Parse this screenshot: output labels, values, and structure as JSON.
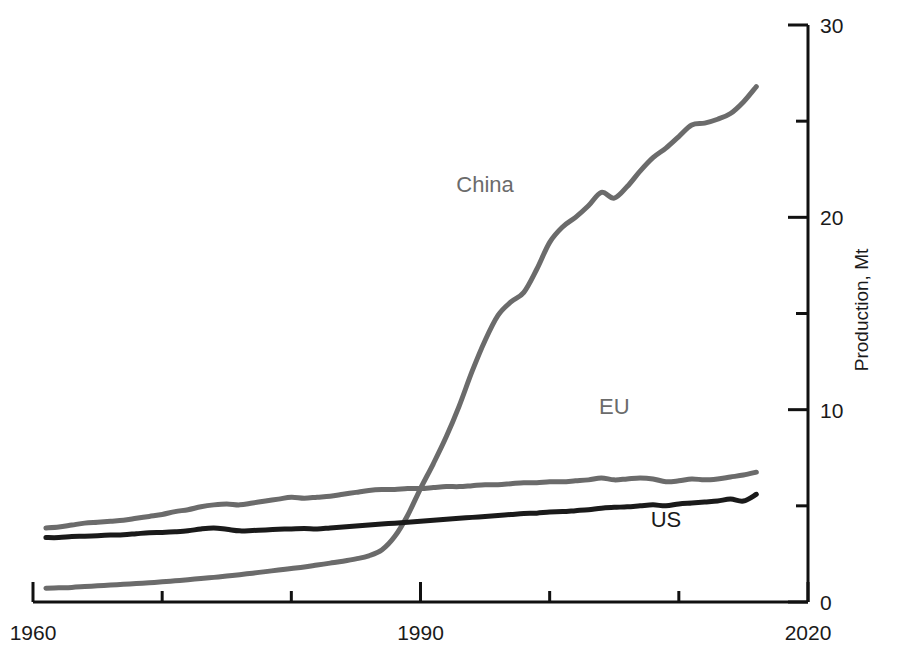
{
  "chart_data": {
    "type": "line",
    "title": "",
    "subtitle": "",
    "xlabel": "",
    "ylabel": "Production, Mt",
    "xlim": [
      1960,
      2020
    ],
    "ylim": [
      0,
      30
    ],
    "x_ticks": [
      1960,
      1990,
      2020
    ],
    "x_tick_labels": [
      "1960",
      "1990",
      "2020"
    ],
    "x_minor_ticks": [
      1970,
      1980,
      2000,
      2010
    ],
    "y_ticks": [
      0,
      10,
      20,
      30
    ],
    "y_tick_labels": [
      "0",
      "10",
      "20",
      "30"
    ],
    "y_minor_ticks": [
      5,
      15,
      25
    ],
    "grid": false,
    "legend_position": "inline-annotations",
    "x": [
      1961,
      1962,
      1963,
      1964,
      1965,
      1966,
      1967,
      1968,
      1969,
      1970,
      1971,
      1972,
      1973,
      1974,
      1975,
      1976,
      1977,
      1978,
      1979,
      1980,
      1981,
      1982,
      1983,
      1984,
      1985,
      1986,
      1987,
      1988,
      1989,
      1990,
      1991,
      1992,
      1993,
      1994,
      1995,
      1996,
      1997,
      1998,
      1999,
      2000,
      2001,
      2002,
      2003,
      2004,
      2005,
      2006,
      2007,
      2008,
      2009,
      2010,
      2011,
      2012,
      2013,
      2014,
      2015,
      2016
    ],
    "series": [
      {
        "name": "China",
        "color": "#6b6b6b",
        "label_x": 1995,
        "label_y": 21.3,
        "values": [
          0.72,
          0.74,
          0.76,
          0.8,
          0.84,
          0.88,
          0.92,
          0.96,
          1.0,
          1.05,
          1.1,
          1.16,
          1.22,
          1.28,
          1.35,
          1.42,
          1.5,
          1.58,
          1.66,
          1.74,
          1.82,
          1.92,
          2.02,
          2.12,
          2.24,
          2.4,
          2.7,
          3.4,
          4.5,
          5.9,
          7.2,
          8.6,
          10.2,
          12.0,
          13.6,
          14.9,
          15.6,
          16.1,
          17.3,
          18.7,
          19.5,
          20.0,
          20.6,
          21.3,
          21.0,
          21.6,
          22.4,
          23.1,
          23.6,
          24.2,
          24.8,
          24.9,
          25.1,
          25.4,
          26.0,
          26.8
        ]
      },
      {
        "name": "EU",
        "color": "#6b6b6b",
        "label_x": 2005,
        "label_y": 9.8,
        "values": [
          3.85,
          3.9,
          4.0,
          4.1,
          4.15,
          4.2,
          4.25,
          4.35,
          4.45,
          4.55,
          4.7,
          4.8,
          4.95,
          5.05,
          5.1,
          5.05,
          5.15,
          5.25,
          5.35,
          5.45,
          5.4,
          5.45,
          5.5,
          5.6,
          5.7,
          5.8,
          5.85,
          5.85,
          5.9,
          5.9,
          5.95,
          6.0,
          6.0,
          6.05,
          6.1,
          6.1,
          6.15,
          6.2,
          6.2,
          6.25,
          6.25,
          6.3,
          6.35,
          6.45,
          6.35,
          6.4,
          6.45,
          6.4,
          6.25,
          6.3,
          6.4,
          6.35,
          6.4,
          6.5,
          6.6,
          6.75
        ]
      },
      {
        "name": "US",
        "color": "#1a1a1a",
        "label_x": 2009,
        "label_y": 3.9,
        "values": [
          3.35,
          3.35,
          3.4,
          3.42,
          3.45,
          3.48,
          3.5,
          3.55,
          3.6,
          3.62,
          3.65,
          3.7,
          3.8,
          3.85,
          3.78,
          3.7,
          3.72,
          3.75,
          3.78,
          3.8,
          3.82,
          3.8,
          3.85,
          3.9,
          3.95,
          4.0,
          4.05,
          4.1,
          4.15,
          4.2,
          4.25,
          4.3,
          4.35,
          4.4,
          4.45,
          4.5,
          4.55,
          4.6,
          4.62,
          4.68,
          4.7,
          4.75,
          4.8,
          4.88,
          4.92,
          4.95,
          5.0,
          5.05,
          5.0,
          5.1,
          5.15,
          5.2,
          5.25,
          5.35,
          5.25,
          5.6
        ]
      }
    ]
  },
  "axes": {
    "y_axis_title": "Production, Mt"
  }
}
